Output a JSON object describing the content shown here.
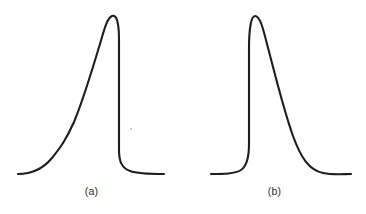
{
  "figure": {
    "background_color": "#ffffff",
    "stroke_color": "#1d1d1d",
    "panel_a_label": "(a)",
    "panel_b_label": "(b)"
  },
  "chart_data": {
    "type": "line",
    "title": "",
    "xlabel": "",
    "ylabel": "",
    "grid": false,
    "legend": "none",
    "axis_visible": false,
    "xlim": [
      0,
      183
    ],
    "ylim": [
      0,
      185
    ],
    "series": [
      {
        "name": "(a)",
        "description": "Asymmetric peak with gradual leading rise and abrupt trailing drop (fronting peak)",
        "panel": "a",
        "baseline_y": 174,
        "peak_x": 108,
        "peak_y": 15,
        "start_x": 18,
        "end_x": 164,
        "path": "M 18,174 C 30,174 42,170 52,158 C 60,148 66,140 74,122 C 84,98 92,70 100,44 C 104,30 107,18 112,16 C 117,14 119,24 119,40 C 119,70 119,120 119,150 C 119,162 122,168 130,171 C 138,174 152,174 164,174"
      },
      {
        "name": "(b)",
        "description": "Asymmetric peak with abrupt leading rise and gradual trailing descent (tailing peak)",
        "panel": "b",
        "baseline_y": 174,
        "peak_x": 68,
        "peak_y": 15,
        "start_x": 28,
        "end_x": 168,
        "path": "M 28,174 C 40,174 52,174 58,170 C 64,166 66,158 66,144 C 66,120 66,80 66,48 C 66,30 68,16 72,16 C 77,16 80,28 84,44 C 92,74 100,108 110,136 C 118,158 126,170 140,173 C 150,175 160,174 168,174"
      }
    ],
    "annotations": [
      {
        "name": "scan-speck",
        "type": "artifact",
        "panel": "a",
        "x": 130,
        "y": 128
      }
    ]
  }
}
